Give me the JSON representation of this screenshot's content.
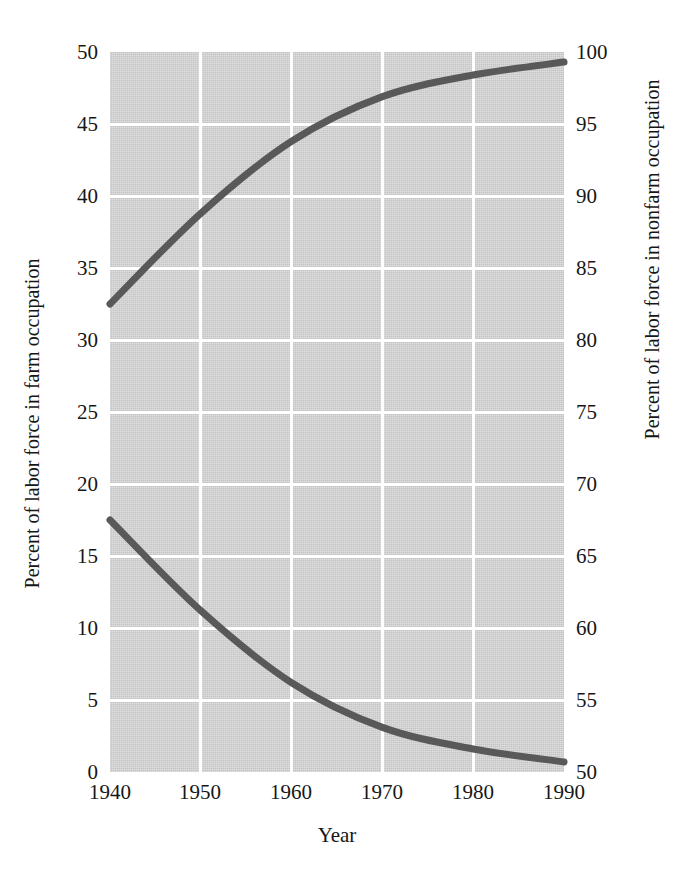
{
  "chart_data": {
    "type": "line",
    "title": "",
    "subtitle": "",
    "xlabel": "Year",
    "ylabel": "Percent of labor force in farm occupation",
    "ylabel_right": "Percent of labor force in nonfarm occupation",
    "x": [
      1940,
      1950,
      1960,
      1970,
      1980,
      1990
    ],
    "xlim": [
      1940,
      1990
    ],
    "ylim": [
      0,
      50
    ],
    "ylim_right": [
      50,
      100
    ],
    "xticks": [
      "1940",
      "1950",
      "1960",
      "1970",
      "1980",
      "1990"
    ],
    "yticks_left": [
      "0",
      "5",
      "10",
      "15",
      "20",
      "25",
      "30",
      "35",
      "40",
      "45",
      "50"
    ],
    "yticks_right": [
      "50",
      "55",
      "60",
      "65",
      "70",
      "75",
      "80",
      "85",
      "90",
      "95",
      "100"
    ],
    "grid": true,
    "legend": "none",
    "plot_background": "#d2d2d2",
    "gridline_color": "#ffffff",
    "line_color": "#595959",
    "series": [
      {
        "name": "Percent of labor force in farm occupation",
        "axis": "left",
        "values": [
          17.5,
          11.2,
          6.2,
          3.1,
          1.6,
          0.7
        ]
      },
      {
        "name": "Percent of labor force in nonfarm occupation",
        "axis": "right",
        "values": [
          82.5,
          88.8,
          93.8,
          96.9,
          98.4,
          99.3
        ],
        "values_on_left_scale": [
          32.5,
          38.8,
          43.8,
          46.9,
          48.4,
          49.3
        ]
      }
    ]
  },
  "axes": {
    "x_label": "Year",
    "y_left_label": "Percent of labor force in farm occupation",
    "y_right_label": "Percent of labor force in nonfarm occupation",
    "x_ticks": [
      "1940",
      "1950",
      "1960",
      "1970",
      "1980",
      "1990"
    ],
    "y_left_ticks": [
      "50",
      "45",
      "40",
      "35",
      "30",
      "25",
      "20",
      "15",
      "10",
      "5",
      "0"
    ],
    "y_right_ticks": [
      "100",
      "95",
      "90",
      "85",
      "80",
      "75",
      "70",
      "65",
      "60",
      "55",
      "50"
    ]
  }
}
